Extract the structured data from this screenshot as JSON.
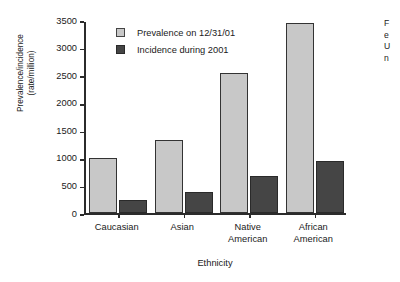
{
  "chart_data": {
    "type": "bar",
    "title": "",
    "xlabel": "Ethnicity",
    "ylabel": "Prevalence/incidence (rate/million)",
    "ylabel_lines": [
      "Prevalence/incidence",
      "(rate/million)"
    ],
    "categories": [
      "Caucasian",
      "Asian",
      "Native American",
      "African American"
    ],
    "category_lines": [
      [
        "Caucasian"
      ],
      [
        "Asian"
      ],
      [
        "Native",
        "American"
      ],
      [
        "African",
        "American"
      ]
    ],
    "series": [
      {
        "name": "Prevalence on 12/31/01",
        "color": "#c8c8c8",
        "values": [
          1000,
          1330,
          2550,
          3450
        ]
      },
      {
        "name": "Incidence during 2001",
        "color": "#454545",
        "values": [
          250,
          390,
          670,
          950
        ]
      }
    ],
    "ylim": [
      0,
      3500
    ],
    "yticks": [
      0,
      500,
      1000,
      1500,
      2000,
      2500,
      3000,
      3500
    ],
    "ytick_labels": [
      "0",
      "500",
      "1000",
      "1500",
      "2000",
      "2500",
      "3000",
      "3500"
    ],
    "grid": false,
    "legend_position": "top-left inside plot area"
  },
  "legend": {
    "entries": [
      {
        "label": "Prevalence on 12/31/01",
        "swatch": "prev"
      },
      {
        "label": "Incidence during 2001",
        "swatch": "inc"
      }
    ]
  },
  "edge_caption": {
    "lines": [
      "F",
      "e",
      "U",
      "n"
    ]
  }
}
